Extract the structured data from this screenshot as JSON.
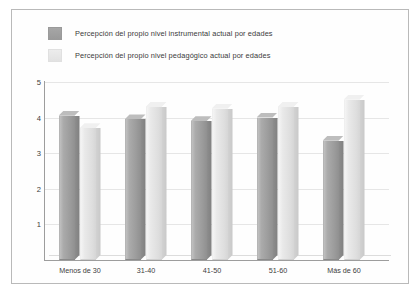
{
  "legend": {
    "items": [
      {
        "label": "Percepción del propio nivel instrumental actual por edades",
        "swatch": "medium-gray",
        "color": "#9e9e9e"
      },
      {
        "label": "Percepción del propio nivel pedagógico actual por edades",
        "swatch": "light-gray",
        "color": "#e6e6e6"
      }
    ]
  },
  "chart_data": {
    "type": "bar",
    "title": "",
    "subtitle": "",
    "xlabel": "",
    "ylabel": "",
    "categories": [
      "Menos de 30",
      "31-40",
      "41-50",
      "51-60",
      "Más de 60"
    ],
    "series": [
      {
        "name": "Percepción del propio nivel instrumental actual por edades",
        "color": "#9e9e9e",
        "values": [
          4.05,
          3.95,
          3.9,
          4.0,
          3.35
        ]
      },
      {
        "name": "Percepción del propio nivel pedagógico actual por edades",
        "color": "#e6e6e6",
        "values": [
          3.7,
          4.3,
          4.25,
          4.3,
          4.5
        ]
      }
    ],
    "yticks": [
      "1",
      "2",
      "3",
      "4",
      "5"
    ],
    "ytick_values": [
      1,
      2,
      3,
      4,
      5
    ],
    "ylim": [
      0,
      5
    ],
    "grid": true,
    "legend_position": "top-left",
    "three_d": true
  }
}
